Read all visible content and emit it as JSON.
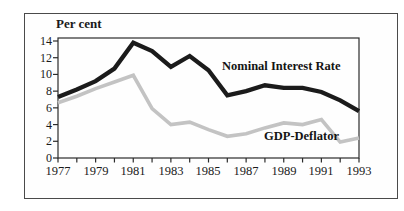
{
  "figure": {
    "y_axis_title": "Per cent"
  },
  "chart_data": {
    "type": "line",
    "title": "",
    "ylabel": "Per cent",
    "xlabel": "",
    "x": [
      1977,
      1978,
      1979,
      1980,
      1981,
      1982,
      1983,
      1984,
      1985,
      1986,
      1987,
      1988,
      1989,
      1990,
      1991,
      1992,
      1993
    ],
    "series": [
      {
        "name": "Nominal Interest Rate",
        "color": "#1b1b1b",
        "values": [
          7.3,
          8.2,
          9.2,
          10.7,
          13.8,
          12.8,
          10.9,
          12.2,
          10.5,
          7.5,
          8.0,
          8.7,
          8.4,
          8.4,
          7.9,
          6.9,
          5.6
        ]
      },
      {
        "name": "GDP-Deflator",
        "color": "#c3c3c3",
        "values": [
          6.6,
          7.4,
          8.3,
          9.1,
          9.9,
          5.9,
          4.0,
          4.3,
          3.4,
          2.6,
          2.9,
          3.6,
          4.2,
          4.0,
          4.6,
          1.9,
          2.4
        ]
      }
    ],
    "xlim": [
      1977,
      1993
    ],
    "ylim": [
      0,
      14
    ],
    "y_ticks": [
      0,
      2,
      4,
      6,
      8,
      10,
      12,
      14
    ],
    "y_tick_labels": [
      "14",
      "12",
      "10",
      "8",
      "6",
      "4",
      "2",
      "0"
    ],
    "x_tick_labels": [
      "1977",
      "1979",
      "1981",
      "1983",
      "1985",
      "1987",
      "1989",
      "1991",
      "1993"
    ],
    "grid": false,
    "legend": "inline-labels"
  }
}
